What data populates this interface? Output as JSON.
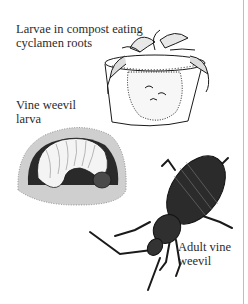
{
  "figure": {
    "labels": {
      "larvae_compost": [
        "Larvae in compost eating",
        "cyclamen roots"
      ],
      "vine_weevil_larva": [
        "Vine weevil",
        "larva"
      ],
      "adult_vine_weevil": [
        "Adult vine",
        "weevil"
      ]
    },
    "illustrations": [
      "potted-cyclamen-with-larvae",
      "curled-weevil-larva-in-soil",
      "adult-vine-weevil-beetle"
    ],
    "colors": {
      "ink": "#1a1a1a",
      "text": "#2b2b2b",
      "rule": "#bdbdbd",
      "background": "#ffffff"
    }
  }
}
